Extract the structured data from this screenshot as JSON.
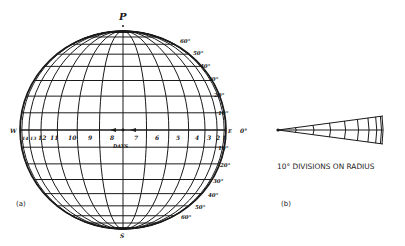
{
  "figure": {
    "panel_a": {
      "label": "(a)",
      "pole_north": "P",
      "pole_south": "S",
      "west_label": "W",
      "east_label": "E",
      "axis_label": "DAYS",
      "day_labels": [
        "14",
        "13",
        "12",
        "11",
        "10",
        "9",
        "8",
        "7",
        "6",
        "5",
        "4",
        "3",
        "2",
        "1"
      ],
      "latitude_labels_north": [
        "60°",
        "50°",
        "40°",
        "30°",
        "20°",
        "10°"
      ],
      "equator_label": "0°",
      "latitude_labels_south": [
        "10°",
        "20°",
        "30°",
        "40°",
        "50°",
        "60°"
      ],
      "grid": {
        "latitude_step_deg": 10,
        "meridian_step_deg": 13.2,
        "projection": "orthographic"
      }
    },
    "panel_b": {
      "label": "(b)",
      "caption": "10° DIVISIONS ON RADIUS",
      "divisions_deg": [
        10,
        20,
        30,
        40,
        50,
        60,
        70,
        80,
        90
      ]
    },
    "colors": {
      "ink": "#1a1a1a",
      "paper": "#ffffff"
    }
  }
}
